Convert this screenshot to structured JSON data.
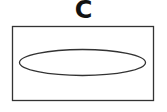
{
  "diagram": {
    "label": "C",
    "shapes": [
      {
        "type": "rectangle",
        "x": 12.5,
        "y": 26.5,
        "width": 141,
        "height": 74
      },
      {
        "type": "ellipse",
        "cx": 82.5,
        "cy": 62.5,
        "rx": 63,
        "ry": 13
      }
    ],
    "stroke_color": "#333333"
  }
}
